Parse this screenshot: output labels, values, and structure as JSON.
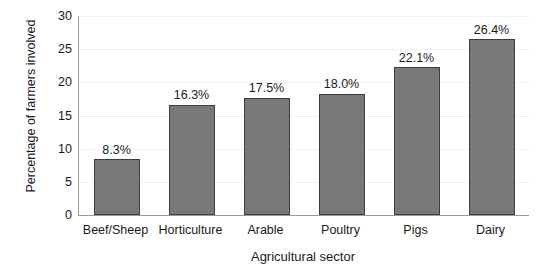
{
  "chart_data": {
    "type": "bar",
    "title": "",
    "xlabel": "Agricultural sector",
    "ylabel": "Percentage of farmers involved",
    "categories": [
      "Beef/Sheep",
      "Horticulture",
      "Arable",
      "Poultry",
      "Pigs",
      "Dairy"
    ],
    "values": [
      8.4,
      16.6,
      17.7,
      18.3,
      22.3,
      26.5
    ],
    "data_labels": [
      "8.3%",
      "16.3%",
      "17.5%",
      "18.0%",
      "22.1%",
      "26.4%"
    ],
    "ylim": [
      0,
      30
    ],
    "ytick_values": [
      0,
      5,
      10,
      15,
      20,
      25,
      30
    ],
    "ytick_labels": [
      "0",
      "5",
      "10",
      "15",
      "20",
      "25",
      "30"
    ],
    "grid": true,
    "grid_axis": "y",
    "legend": false,
    "legend_position": "none",
    "bar_fill_color": "#787878",
    "bar_border_color": "#3d3d3d",
    "gridline_color": "#f2f2f2",
    "axis_color": "#9a9a9a",
    "text_color": "#1a1a1a",
    "background_color": "#ffffff"
  }
}
